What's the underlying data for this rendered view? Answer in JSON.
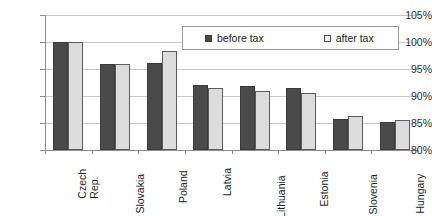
{
  "chart_data": {
    "type": "bar",
    "title": "",
    "xlabel": "",
    "ylabel": "",
    "ylim": [
      80,
      105
    ],
    "ytick_values": [
      105,
      100,
      95,
      90,
      85,
      80
    ],
    "ytick_labels": [
      "105%",
      "100%",
      "95%",
      "90%",
      "85%",
      "80%"
    ],
    "grid": true,
    "legend_position": "upper-right-inside",
    "categories": [
      "Czech Rep.",
      "Slovakia",
      "Poland",
      "Latvia",
      "Lithuania",
      "Estonia",
      "Slovenia",
      "Hungary"
    ],
    "category_lines": [
      [
        "Czech",
        "Rep."
      ],
      [
        "Slovakia"
      ],
      [
        "Poland"
      ],
      [
        "Latvia"
      ],
      [
        "Lithuania"
      ],
      [
        "Estonia"
      ],
      [
        "Slovenia"
      ],
      [
        "Hungary"
      ]
    ],
    "series": [
      {
        "name": "before tax",
        "color": "#4a4a4a",
        "values": [
          100.0,
          96.0,
          96.2,
          92.0,
          91.8,
          91.5,
          85.8,
          85.2
        ]
      },
      {
        "name": "after tax",
        "color": "#dcdcdc",
        "values": [
          100.0,
          96.0,
          98.4,
          91.5,
          91.0,
          90.6,
          86.3,
          85.6
        ]
      }
    ]
  },
  "legend": {
    "entries": [
      {
        "label": "before tax",
        "swatch": "filled-dark-square-icon"
      },
      {
        "label": "after tax",
        "swatch": "outlined-light-square-icon"
      }
    ]
  },
  "caption": {
    "text": ""
  }
}
